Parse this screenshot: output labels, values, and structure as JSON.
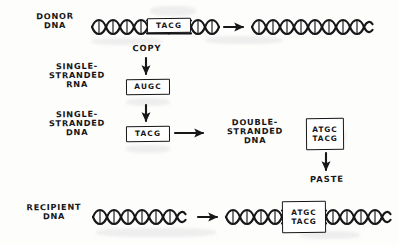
{
  "diagram": {
    "ink_color": "#17171a",
    "paper_color": "#fdfdfc",
    "rows": [
      {
        "id": "donor",
        "label": "DONOR\nDNA",
        "sequence": "TACG"
      },
      {
        "id": "ssrna",
        "label": "SINGLE-\nSTRANDED\nRNA",
        "sequence": "AUGC"
      },
      {
        "id": "ssdna",
        "label": "SINGLE-\nSTRANDED\nDNA",
        "sequence": "TACG"
      },
      {
        "id": "dsdna",
        "label": "DOUBLE-\nSTRANDED\nDNA",
        "sequence_top": "ATGC",
        "sequence_bottom": "TACG"
      },
      {
        "id": "recipient",
        "label": "RECIPIENT\nDNA",
        "sequence_top": "ATGC",
        "sequence_bottom": "TACG"
      }
    ],
    "steps": [
      {
        "id": "copy",
        "label": "COPY"
      },
      {
        "id": "paste",
        "label": "PASTE"
      }
    ]
  }
}
